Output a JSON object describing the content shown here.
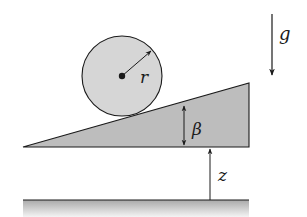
{
  "diagram": {
    "type": "physics-figure",
    "colors": {
      "background": "#ffffff",
      "cylinder_fill": "#d6d6d6",
      "wedge_fill": "#bdbdbd",
      "ground_top": "#a9a9a9",
      "ground_bottom": "#f2f2f2",
      "stroke": "#1a1a1a"
    },
    "labels": {
      "radius": "r",
      "angle": "β",
      "height": "z",
      "gravity": "g"
    },
    "elements": {
      "cylinder": {
        "center": [
          122,
          76
        ],
        "radius": 40
      },
      "wedge": {
        "points": [
          [
            23,
            147
          ],
          [
            249,
            83
          ],
          [
            249,
            147
          ]
        ]
      },
      "ground": {
        "y": 200,
        "x_start": 23,
        "x_end": 249
      },
      "gravity_arrow": {
        "x": 272,
        "y_start": 14,
        "y_end": 75
      },
      "height_arrow": {
        "x": 210,
        "y_start": 200,
        "y_end": 148
      },
      "angle_arrow": {
        "x": 184,
        "y_start": 104,
        "y_end": 147
      }
    }
  }
}
